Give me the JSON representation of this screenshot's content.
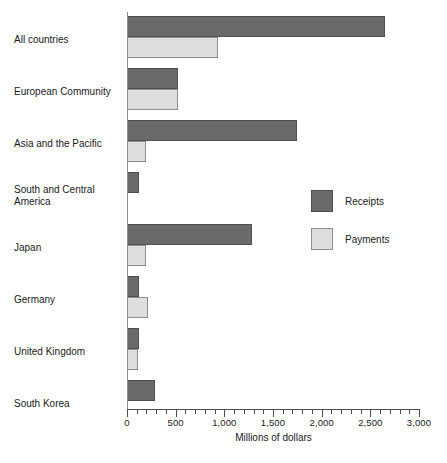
{
  "chart_data": {
    "type": "bar",
    "orientation": "horizontal",
    "title": "",
    "xlabel": "Millions of dollars",
    "ylabel": "",
    "xlim": [
      0,
      3000
    ],
    "xticks": [
      0,
      500,
      1000,
      1500,
      2000,
      2500,
      3000
    ],
    "xticklabels": [
      "0",
      "500",
      "1,000",
      "1,500",
      "2,000",
      "2,500",
      "3,000"
    ],
    "minor_tick_interval": 100,
    "grid": false,
    "legend_position": "middle-right",
    "categories": [
      "All countries",
      "European Community",
      "Asia and the Pacific",
      "South and Central America",
      "Japan",
      "Germany",
      "United Kingdom",
      "South Korea"
    ],
    "series": [
      {
        "name": "Receipts",
        "color": "#6a6a6a",
        "values": [
          2650,
          520,
          1750,
          120,
          1280,
          120,
          120,
          285
        ]
      },
      {
        "name": "Payments",
        "color": "#dedede",
        "values": [
          930,
          520,
          195,
          0,
          195,
          215,
          110,
          0
        ]
      }
    ]
  },
  "axis": {
    "x_label": "Millions of dollars"
  },
  "legend": {
    "items": [
      {
        "label": "Receipts",
        "swatch": "receipts"
      },
      {
        "label": "Payments",
        "swatch": "payments"
      }
    ]
  },
  "caption": {
    "text": ""
  }
}
